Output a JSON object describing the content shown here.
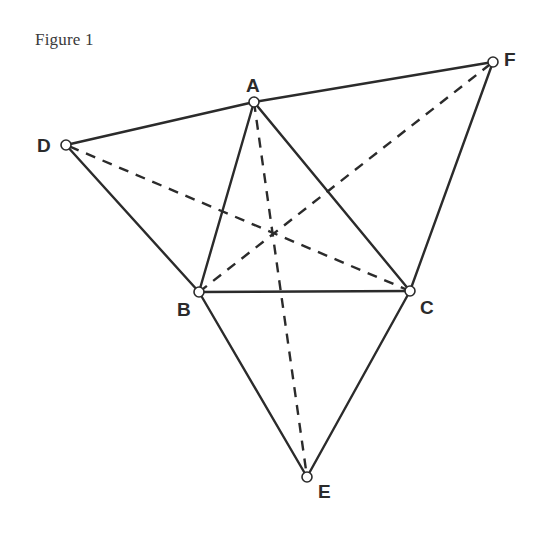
{
  "caption": "Figure 1",
  "colors": {
    "stroke": "#2b2b2b",
    "vertex_fill": "#ffffff",
    "background": "#ffffff"
  },
  "points": {
    "A": {
      "label": "A",
      "x": 254,
      "y": 102,
      "label_x": 246,
      "label_y": 92
    },
    "B": {
      "label": "B",
      "x": 199,
      "y": 292,
      "label_x": 177,
      "label_y": 316
    },
    "C": {
      "label": "C",
      "x": 410,
      "y": 291,
      "label_x": 420,
      "label_y": 314
    },
    "D": {
      "label": "D",
      "x": 66,
      "y": 145,
      "label_x": 37,
      "label_y": 152
    },
    "E": {
      "label": "E",
      "x": 307,
      "y": 477,
      "label_x": 318,
      "label_y": 498
    },
    "F": {
      "label": "F",
      "x": 493,
      "y": 62,
      "label_x": 504,
      "label_y": 66
    }
  },
  "solid_segments": [
    [
      "A",
      "B"
    ],
    [
      "B",
      "C"
    ],
    [
      "C",
      "A"
    ],
    [
      "D",
      "A"
    ],
    [
      "D",
      "B"
    ],
    [
      "F",
      "A"
    ],
    [
      "F",
      "C"
    ],
    [
      "E",
      "B"
    ],
    [
      "E",
      "C"
    ]
  ],
  "dashed_segments": [
    [
      "A",
      "E"
    ],
    [
      "B",
      "F"
    ],
    [
      "C",
      "D"
    ]
  ]
}
